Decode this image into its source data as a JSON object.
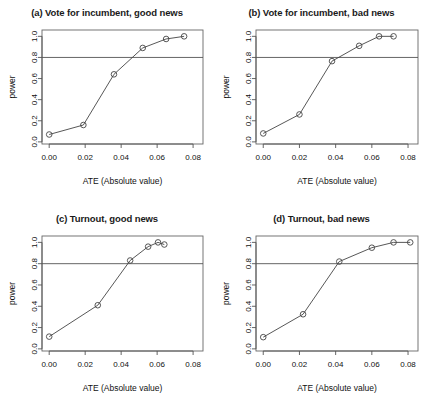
{
  "figure": {
    "width": 429,
    "height": 413,
    "background": "#ffffff",
    "ink_color": "#444444"
  },
  "shared": {
    "xlabel": "ATE (Absolute value)",
    "ylabel": "power",
    "xticks": [
      "0.00",
      "0.02",
      "0.04",
      "0.06",
      "0.08"
    ],
    "xtick_values": [
      0.0,
      0.02,
      0.04,
      0.06,
      0.08
    ],
    "yticks": [
      "0.0",
      "0.2",
      "0.4",
      "0.6",
      "0.8",
      "1.0"
    ],
    "ytick_values": [
      0.0,
      0.2,
      0.4,
      0.6,
      0.8,
      1.0
    ],
    "xlim": [
      -0.004,
      0.0855
    ],
    "ylim": [
      -0.02,
      1.06
    ],
    "threshold_value": 0.8,
    "threshold_label": "0.8"
  },
  "chart_data": [
    {
      "type": "line",
      "panel": "a",
      "title": "(a) Vote for incumbent, good news",
      "xlabel": "ATE (Absolute value)",
      "ylabel": "power",
      "xlim": [
        -0.004,
        0.0855
      ],
      "ylim": [
        -0.02,
        1.06
      ],
      "grid": false,
      "legend": "none",
      "marker": "open-circle",
      "hline": 0.8,
      "x": [
        0.0,
        0.019,
        0.036,
        0.052,
        0.065,
        0.075
      ],
      "values": [
        0.07,
        0.16,
        0.64,
        0.89,
        0.975,
        1.0
      ]
    },
    {
      "type": "line",
      "panel": "b",
      "title": "(b) Vote for incumbent, bad news",
      "xlabel": "ATE (Absolute value)",
      "ylabel": "power",
      "xlim": [
        -0.004,
        0.0855
      ],
      "ylim": [
        -0.02,
        1.06
      ],
      "grid": false,
      "legend": "none",
      "marker": "open-circle",
      "hline": 0.8,
      "x": [
        0.0,
        0.02,
        0.038,
        0.053,
        0.064,
        0.072
      ],
      "values": [
        0.08,
        0.26,
        0.765,
        0.91,
        1.0,
        1.0
      ]
    },
    {
      "type": "line",
      "panel": "c",
      "title": "(c) Turnout, good news",
      "xlabel": "ATE (Absolute value)",
      "ylabel": "power",
      "xlim": [
        -0.004,
        0.0855
      ],
      "ylim": [
        -0.02,
        1.06
      ],
      "grid": false,
      "legend": "none",
      "marker": "open-circle",
      "hline": 0.8,
      "x": [
        0.0,
        0.027,
        0.045,
        0.055,
        0.0605,
        0.064
      ],
      "values": [
        0.115,
        0.41,
        0.83,
        0.96,
        1.0,
        0.98
      ]
    },
    {
      "type": "line",
      "panel": "d",
      "title": "(d) Turnout, bad news",
      "xlabel": "ATE (Absolute value)",
      "ylabel": "power",
      "xlim": [
        -0.004,
        0.0855
      ],
      "ylim": [
        -0.02,
        1.06
      ],
      "grid": false,
      "legend": "none",
      "marker": "open-circle",
      "hline": 0.8,
      "x": [
        0.0,
        0.022,
        0.042,
        0.06,
        0.072,
        0.0812
      ],
      "values": [
        0.11,
        0.325,
        0.82,
        0.95,
        1.0,
        1.0
      ]
    }
  ]
}
